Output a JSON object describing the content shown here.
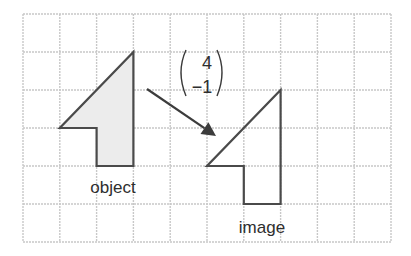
{
  "diagram": {
    "type": "translation-on-grid",
    "grid": {
      "origin_px": [
        23,
        14
      ],
      "columns": 10,
      "rows": 6,
      "cell_width_px": 36.8,
      "cell_height_px": 38,
      "line_color": "#c8c8c8"
    },
    "object": {
      "label": "object",
      "fill": "#ececec",
      "stroke": "#4a4a4a",
      "vertices_grid": [
        [
          3,
          1
        ],
        [
          3,
          4
        ],
        [
          2,
          4
        ],
        [
          2,
          3
        ],
        [
          1,
          3
        ]
      ]
    },
    "image": {
      "label": "image",
      "stroke": "#4a4a4a",
      "vertices_grid": [
        [
          7,
          2
        ],
        [
          7,
          5
        ],
        [
          6,
          5
        ],
        [
          6,
          4
        ],
        [
          5,
          4
        ]
      ]
    },
    "translation_vector": {
      "top": "4",
      "bottom": "−1",
      "arrow_from_px": [
        147,
        89
      ],
      "arrow_to_px": [
        216,
        136
      ]
    }
  }
}
